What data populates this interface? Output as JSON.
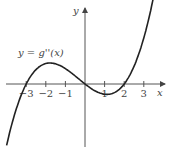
{
  "chart_data": {
    "type": "line",
    "title": "",
    "curve_label": "y = g''(x)",
    "xlabel": "x",
    "ylabel": "y",
    "x_ticks": [
      -3,
      -2,
      -1,
      1,
      2,
      3
    ],
    "x_tick_labels": [
      "−3",
      "−2",
      "−1",
      "1",
      "2",
      "3"
    ],
    "roots": [
      -3,
      0,
      2
    ],
    "series": [
      {
        "name": "g''(x)",
        "x": [
          -3.9,
          -3,
          -1.8,
          0,
          1.1,
          2,
          3,
          3.5
        ],
        "y": [
          -20.7,
          0,
          8.2,
          0,
          -2.7,
          0,
          18,
          34.1
        ]
      }
    ],
    "xlim": [
      -4,
      3.8
    ],
    "grid": false,
    "colors": {
      "curve": "#222222",
      "axes": "#555555"
    }
  }
}
